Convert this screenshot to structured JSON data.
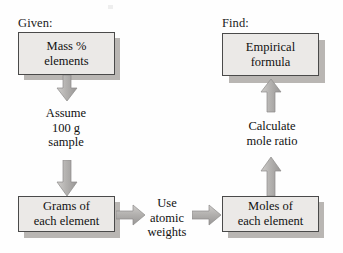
{
  "diagram": {
    "captions": [
      {
        "id": "given",
        "label": "Given:"
      },
      {
        "id": "find",
        "label": "Find:"
      }
    ],
    "boxes": [
      {
        "id": "mass-percent",
        "label": "Mass %\nelements"
      },
      {
        "id": "empirical-formula",
        "label": "Empirical\nformula"
      },
      {
        "id": "grams",
        "label": "Grams of\neach element"
      },
      {
        "id": "moles",
        "label": "Moles of\neach element"
      }
    ],
    "connector_labels": [
      {
        "id": "assume",
        "label": "Assume\n100 g\nsample"
      },
      {
        "id": "use-atomic-weights",
        "label": "Use\natomic\nweights"
      },
      {
        "id": "calculate-mole-ratio",
        "label": "Calculate\nmole ratio"
      }
    ],
    "arrows": [
      {
        "id": "mass-to-assume",
        "direction": "down"
      },
      {
        "id": "assume-to-grams",
        "direction": "down"
      },
      {
        "id": "grams-to-use",
        "direction": "right"
      },
      {
        "id": "use-to-moles",
        "direction": "right"
      },
      {
        "id": "moles-to-calculate",
        "direction": "up"
      },
      {
        "id": "calculate-to-formula",
        "direction": "up"
      }
    ],
    "colors": {
      "box_fill": "#ebe9e7",
      "box_border": "#4a4a4a",
      "box_shadow": "#b9b6b3",
      "arrow_fill": "#b0aeac",
      "arrow_stroke": "#8d8b89",
      "text": "#111111",
      "page_background": "#fefefe"
    }
  }
}
